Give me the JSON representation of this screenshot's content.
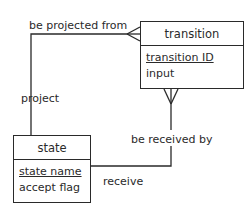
{
  "diagram": {
    "type": "entity-relationship",
    "entities": [
      {
        "name": "transition",
        "attributes": [
          {
            "label": "transition ID",
            "primary_key": true
          },
          {
            "label": "input",
            "primary_key": false
          }
        ]
      },
      {
        "name": "state",
        "attributes": [
          {
            "label": "state name",
            "primary_key": true
          },
          {
            "label": "accept flag",
            "primary_key": false
          }
        ]
      }
    ],
    "relationships": [
      {
        "from": "state",
        "to": "transition",
        "label_near_state": "project",
        "label_near_transition": "be projected from",
        "cardinality_at_transition": "many"
      },
      {
        "from": "state",
        "to": "transition",
        "label_near_state": "receive",
        "label_near_transition": "be received by",
        "cardinality_at_transition": "many"
      }
    ],
    "colors": {
      "line": "#2a2a2a",
      "background": "#ffffff"
    }
  }
}
